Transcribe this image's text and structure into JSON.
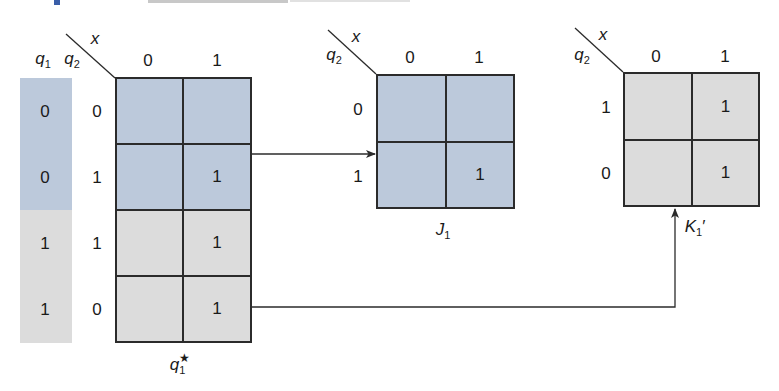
{
  "colors": {
    "blue_fill": "#bcc9db",
    "gray_fill": "#dcdcdc",
    "line": "#2b2b2b",
    "header_accent": "#3a5ea8"
  },
  "header": {
    "cropped": true
  },
  "q1_column": {
    "header_q1": "q",
    "header_q1_sub": "1",
    "values": [
      "0",
      "0",
      "1",
      "1"
    ],
    "fills": [
      "blue",
      "blue",
      "gray",
      "gray"
    ]
  },
  "main_map": {
    "var_row": "q",
    "var_row_sub": "2",
    "var_col": "x",
    "col_headers": [
      "0",
      "1"
    ],
    "row_headers": [
      "0",
      "1",
      "1",
      "0"
    ],
    "cells": [
      [
        "",
        ""
      ],
      [
        "",
        "1"
      ],
      [
        "",
        "1"
      ],
      [
        "",
        "1"
      ]
    ],
    "label_base": "q",
    "label_sub": "1",
    "label_sup": "★"
  },
  "j_map": {
    "var_row": "q",
    "var_row_sub": "2",
    "var_col": "x",
    "col_headers": [
      "0",
      "1"
    ],
    "row_headers": [
      "0",
      "1"
    ],
    "cells": [
      [
        "",
        ""
      ],
      [
        "",
        "1"
      ]
    ],
    "label_base": "J",
    "label_sub": "1",
    "fill": "blue"
  },
  "k_map": {
    "var_row": "q",
    "var_row_sub": "2",
    "var_col": "x",
    "col_headers": [
      "0",
      "1"
    ],
    "row_headers": [
      "1",
      "0"
    ],
    "cells": [
      [
        "",
        "1"
      ],
      [
        "",
        "1"
      ]
    ],
    "label_base": "K",
    "label_sub": "1",
    "label_prime": "′",
    "fill": "gray"
  },
  "arrows": [
    {
      "from": "main_map.rows[0..1]",
      "to": "j_map",
      "description": "upper half (q1=0) maps to J1"
    },
    {
      "from": "main_map.rows[2..3]",
      "to": "k_map",
      "description": "lower half (q1=1) maps to K1'"
    }
  ]
}
